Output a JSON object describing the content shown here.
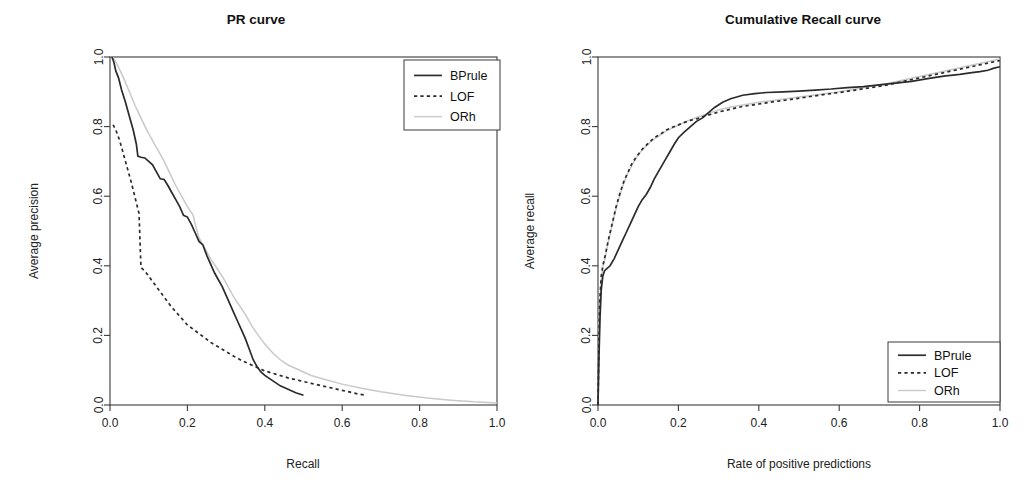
{
  "figure": {
    "background_color": "#ffffff",
    "panel_count": 2
  },
  "panels": [
    {
      "id": "pr-curve",
      "title": "PR curve",
      "xlabel": "Recall",
      "ylabel": "Average precision",
      "legend_position": "top-right",
      "x_ticks": [
        "0.0",
        "0.2",
        "0.4",
        "0.6",
        "0.8",
        "1.0"
      ],
      "y_ticks": [
        "0.0",
        "0.2",
        "0.4",
        "0.6",
        "0.8",
        "1.0"
      ],
      "legend": [
        {
          "label": "BPrule",
          "style": "solid",
          "color": "#2b2b2b"
        },
        {
          "label": "LOF",
          "style": "dashed",
          "color": "#2b2b2b"
        },
        {
          "label": "ORh",
          "style": "solid-light",
          "color": "#c9c9c9"
        }
      ]
    },
    {
      "id": "cumulative-recall-curve",
      "title": "Cumulative Recall curve",
      "xlabel": "Rate of positive predictions",
      "ylabel": "Average recall",
      "legend_position": "bottom-right",
      "x_ticks": [
        "0.0",
        "0.2",
        "0.4",
        "0.6",
        "0.8",
        "1.0"
      ],
      "y_ticks": [
        "0.0",
        "0.2",
        "0.4",
        "0.6",
        "0.8",
        "1.0"
      ],
      "legend": [
        {
          "label": "BPrule",
          "style": "solid",
          "color": "#2b2b2b"
        },
        {
          "label": "LOF",
          "style": "dashed",
          "color": "#2b2b2b"
        },
        {
          "label": "ORh",
          "style": "solid-light",
          "color": "#c9c9c9"
        }
      ]
    }
  ],
  "chart_data": [
    {
      "type": "line",
      "title": "PR curve",
      "xlabel": "Recall",
      "ylabel": "Average precision",
      "xlim": [
        0.0,
        1.0
      ],
      "ylim": [
        0.0,
        1.0
      ],
      "grid": false,
      "legend_position": "top-right",
      "series": [
        {
          "name": "BPrule",
          "style": "solid",
          "color": "#2b2b2b",
          "x": [
            0.005,
            0.01,
            0.015,
            0.022,
            0.03,
            0.04,
            0.05,
            0.06,
            0.068,
            0.072,
            0.08,
            0.09,
            0.1,
            0.11,
            0.12,
            0.13,
            0.14,
            0.15,
            0.16,
            0.17,
            0.18,
            0.19,
            0.2,
            0.21,
            0.22,
            0.23,
            0.24,
            0.25,
            0.26,
            0.27,
            0.28,
            0.29,
            0.3,
            0.31,
            0.32,
            0.33,
            0.34,
            0.35,
            0.36,
            0.37,
            0.38,
            0.39,
            0.4,
            0.42,
            0.44,
            0.46,
            0.48,
            0.5
          ],
          "y": [
            1.0,
            0.985,
            0.96,
            0.94,
            0.905,
            0.87,
            0.83,
            0.79,
            0.75,
            0.715,
            0.712,
            0.71,
            0.7,
            0.69,
            0.67,
            0.65,
            0.648,
            0.63,
            0.61,
            0.59,
            0.57,
            0.545,
            0.54,
            0.52,
            0.495,
            0.47,
            0.46,
            0.43,
            0.405,
            0.38,
            0.36,
            0.34,
            0.315,
            0.29,
            0.265,
            0.24,
            0.215,
            0.19,
            0.16,
            0.13,
            0.11,
            0.095,
            0.085,
            0.07,
            0.055,
            0.045,
            0.035,
            0.028
          ]
        },
        {
          "name": "LOF",
          "style": "dashed",
          "color": "#2b2b2b",
          "x": [
            0.008,
            0.015,
            0.025,
            0.035,
            0.045,
            0.055,
            0.065,
            0.075,
            0.08,
            0.09,
            0.1,
            0.11,
            0.12,
            0.13,
            0.14,
            0.15,
            0.16,
            0.17,
            0.18,
            0.19,
            0.2,
            0.215,
            0.23,
            0.245,
            0.26,
            0.275,
            0.29,
            0.305,
            0.32,
            0.34,
            0.36,
            0.38,
            0.4,
            0.43,
            0.46,
            0.49,
            0.52,
            0.56,
            0.6,
            0.64,
            0.66
          ],
          "y": [
            0.805,
            0.79,
            0.76,
            0.72,
            0.68,
            0.64,
            0.595,
            0.55,
            0.395,
            0.385,
            0.37,
            0.355,
            0.34,
            0.325,
            0.31,
            0.295,
            0.28,
            0.268,
            0.255,
            0.243,
            0.23,
            0.218,
            0.205,
            0.193,
            0.18,
            0.17,
            0.16,
            0.15,
            0.14,
            0.128,
            0.118,
            0.108,
            0.098,
            0.088,
            0.078,
            0.07,
            0.062,
            0.052,
            0.042,
            0.032,
            0.028
          ]
        },
        {
          "name": "ORh",
          "style": "solid-light",
          "color": "#c9c9c9",
          "x": [
            0.008,
            0.02,
            0.035,
            0.05,
            0.065,
            0.08,
            0.095,
            0.11,
            0.125,
            0.14,
            0.155,
            0.17,
            0.185,
            0.2,
            0.215,
            0.22,
            0.23,
            0.245,
            0.26,
            0.275,
            0.29,
            0.305,
            0.32,
            0.335,
            0.35,
            0.365,
            0.38,
            0.4,
            0.42,
            0.44,
            0.46,
            0.49,
            0.52,
            0.56,
            0.6,
            0.65,
            0.7,
            0.76,
            0.82,
            0.88,
            0.94,
            1.0
          ],
          "y": [
            1.0,
            0.975,
            0.94,
            0.9,
            0.86,
            0.825,
            0.79,
            0.76,
            0.73,
            0.7,
            0.665,
            0.63,
            0.6,
            0.57,
            0.545,
            0.52,
            0.48,
            0.45,
            0.42,
            0.395,
            0.37,
            0.34,
            0.31,
            0.285,
            0.26,
            0.23,
            0.205,
            0.175,
            0.15,
            0.13,
            0.115,
            0.1,
            0.085,
            0.072,
            0.06,
            0.048,
            0.038,
            0.028,
            0.02,
            0.014,
            0.009,
            0.006
          ]
        }
      ]
    },
    {
      "type": "line",
      "title": "Cumulative Recall curve",
      "xlabel": "Rate of positive predictions",
      "ylabel": "Average recall",
      "xlim": [
        0.0,
        1.0
      ],
      "ylim": [
        0.0,
        1.0
      ],
      "grid": false,
      "legend_position": "bottom-right",
      "series": [
        {
          "name": "BPrule",
          "style": "solid",
          "color": "#2b2b2b",
          "x": [
            0.0,
            0.002,
            0.005,
            0.008,
            0.012,
            0.016,
            0.02,
            0.03,
            0.04,
            0.05,
            0.06,
            0.07,
            0.08,
            0.09,
            0.1,
            0.11,
            0.12,
            0.13,
            0.14,
            0.15,
            0.16,
            0.17,
            0.18,
            0.19,
            0.2,
            0.215,
            0.23,
            0.245,
            0.26,
            0.275,
            0.29,
            0.31,
            0.33,
            0.36,
            0.39,
            0.42,
            0.46,
            0.5,
            0.54,
            0.58,
            0.62,
            0.66,
            0.7,
            0.74,
            0.78,
            0.82,
            0.86,
            0.9,
            0.93,
            0.95,
            0.97,
            0.985,
            1.0
          ],
          "y": [
            0.0,
            0.12,
            0.25,
            0.33,
            0.37,
            0.385,
            0.39,
            0.4,
            0.42,
            0.445,
            0.47,
            0.495,
            0.52,
            0.545,
            0.57,
            0.59,
            0.605,
            0.625,
            0.65,
            0.67,
            0.69,
            0.71,
            0.73,
            0.75,
            0.768,
            0.785,
            0.8,
            0.815,
            0.825,
            0.84,
            0.855,
            0.87,
            0.88,
            0.89,
            0.895,
            0.898,
            0.9,
            0.902,
            0.905,
            0.908,
            0.912,
            0.915,
            0.92,
            0.925,
            0.93,
            0.938,
            0.945,
            0.95,
            0.955,
            0.958,
            0.962,
            0.968,
            0.972
          ]
        },
        {
          "name": "LOF",
          "style": "dashed",
          "color": "#2b2b2b",
          "x": [
            0.0,
            0.002,
            0.004,
            0.008,
            0.012,
            0.018,
            0.025,
            0.035,
            0.045,
            0.055,
            0.065,
            0.075,
            0.085,
            0.095,
            0.11,
            0.125,
            0.14,
            0.155,
            0.17,
            0.185,
            0.2,
            0.215,
            0.23,
            0.245,
            0.26,
            0.28,
            0.3,
            0.33,
            0.36,
            0.4,
            0.44,
            0.48,
            0.52,
            0.56,
            0.6,
            0.64,
            0.68,
            0.72,
            0.76,
            0.8,
            0.84,
            0.88,
            0.92,
            0.96,
            1.0
          ],
          "y": [
            0.0,
            0.15,
            0.29,
            0.37,
            0.4,
            0.43,
            0.47,
            0.52,
            0.57,
            0.61,
            0.645,
            0.67,
            0.695,
            0.712,
            0.735,
            0.752,
            0.768,
            0.778,
            0.79,
            0.798,
            0.805,
            0.812,
            0.818,
            0.822,
            0.828,
            0.835,
            0.842,
            0.85,
            0.858,
            0.865,
            0.872,
            0.878,
            0.885,
            0.892,
            0.898,
            0.905,
            0.912,
            0.92,
            0.93,
            0.94,
            0.95,
            0.96,
            0.97,
            0.98,
            0.99
          ]
        },
        {
          "name": "ORh",
          "style": "solid-light",
          "color": "#c9c9c9",
          "x": [
            0.0,
            0.002,
            0.004,
            0.008,
            0.012,
            0.018,
            0.025,
            0.035,
            0.045,
            0.055,
            0.065,
            0.075,
            0.085,
            0.095,
            0.11,
            0.125,
            0.14,
            0.155,
            0.17,
            0.185,
            0.2,
            0.215,
            0.23,
            0.245,
            0.26,
            0.28,
            0.3,
            0.33,
            0.36,
            0.4,
            0.44,
            0.48,
            0.52,
            0.56,
            0.6,
            0.64,
            0.68,
            0.72,
            0.76,
            0.8,
            0.84,
            0.88,
            0.92,
            0.96,
            1.0
          ],
          "y": [
            0.0,
            0.14,
            0.28,
            0.36,
            0.395,
            0.425,
            0.465,
            0.515,
            0.565,
            0.605,
            0.64,
            0.668,
            0.69,
            0.71,
            0.733,
            0.75,
            0.765,
            0.776,
            0.788,
            0.796,
            0.804,
            0.812,
            0.82,
            0.826,
            0.832,
            0.84,
            0.848,
            0.856,
            0.862,
            0.87,
            0.876,
            0.882,
            0.888,
            0.894,
            0.9,
            0.908,
            0.916,
            0.924,
            0.934,
            0.944,
            0.954,
            0.964,
            0.974,
            0.984,
            0.994
          ]
        }
      ]
    }
  ]
}
